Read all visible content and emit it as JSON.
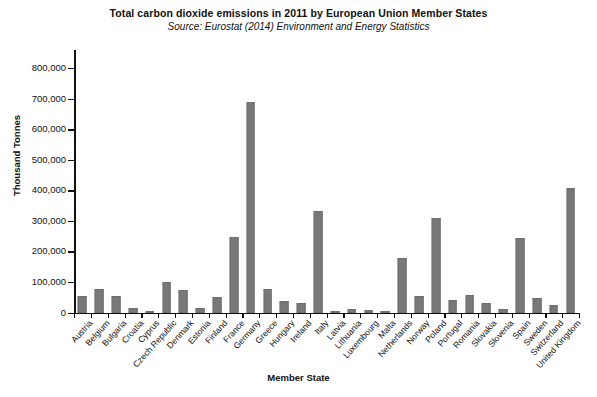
{
  "chart_data": {
    "type": "bar",
    "title": "Total carbon dioxide emissions in 2011 by European Union Member States",
    "subtitle": "Source: Eurostat (2014) Environment and Energy Statistics",
    "xlabel": "Member State",
    "ylabel": "Thousand Tonnes",
    "ylim": [
      0,
      800000
    ],
    "ytick_step": 100000,
    "ytick_labels": [
      "0",
      "100,000",
      "200,000",
      "300,000",
      "400,000",
      "500,000",
      "600,000",
      "700,000",
      "800,000"
    ],
    "ytick_values": [
      0,
      100000,
      200000,
      300000,
      400000,
      500000,
      600000,
      700000,
      800000
    ],
    "grid": false,
    "legend": null,
    "bar_color": "#787878",
    "background_color": "#ffffff",
    "axis_color": "#111111",
    "categories": [
      "Austria",
      "Belgium",
      "Bulgaria",
      "Croatia",
      "Cyprus",
      "Czech Republic",
      "Denmark",
      "Estonia",
      "Finland",
      "France",
      "Germany",
      "Greece",
      "Hungary",
      "Ireland",
      "Italy",
      "Latvia",
      "Lithuania",
      "Luxembourg",
      "Malta",
      "Netherlands",
      "Norway",
      "Poland",
      "Portugal",
      "Romania",
      "Slovakia",
      "Slovenia",
      "Spain",
      "Sweden",
      "Switzerland",
      "United Kingdom"
    ],
    "values": [
      57000,
      80000,
      55000,
      18000,
      7000,
      100000,
      76000,
      17000,
      54000,
      248000,
      689000,
      80000,
      38000,
      34000,
      333000,
      7000,
      12000,
      10000,
      3000,
      180000,
      55000,
      310000,
      44000,
      60000,
      34000,
      14000,
      245000,
      50000,
      27000,
      408000
    ]
  }
}
